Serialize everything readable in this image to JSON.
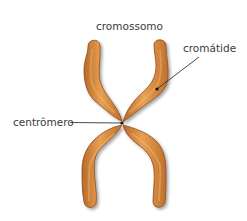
{
  "diagram": {
    "title": "cromossomo",
    "labels": {
      "chromosome": "cromossomo",
      "chromatid": "cromátide",
      "centromere": "centrômero"
    },
    "colors": {
      "chromatid_fill": "#d9873a",
      "chromatid_highlight": "#eca85a",
      "chromatid_edge": "#8a4a1c",
      "leader_line": "#333333",
      "background": "#ffffff"
    },
    "structure": {
      "chromatids": 2,
      "arms": [
        "upper-left",
        "upper-right",
        "lower-left",
        "lower-right"
      ],
      "centromere_point": [
        122,
        123
      ],
      "chromatid_pointer": [
        157,
        89
      ]
    }
  }
}
